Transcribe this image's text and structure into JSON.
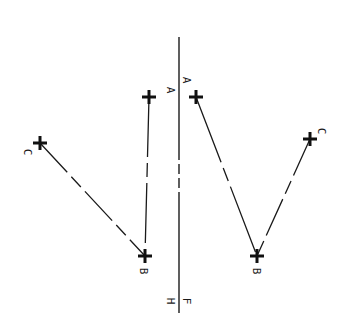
{
  "diagram": {
    "title": "",
    "colors": {
      "background": "#ffffff",
      "ink": "#1a1a1a"
    },
    "fold_line": {
      "x": 179,
      "y_top": 37,
      "y_bottom": 313,
      "top_labels": [
        "A",
        "A"
      ],
      "bottom_labels": [
        "H",
        "F"
      ],
      "dashed_segment": [
        150,
        200
      ]
    },
    "left_view": {
      "points": {
        "A": {
          "label": "A",
          "x": 149,
          "y": 97
        },
        "B": {
          "label": "B",
          "x": 145,
          "y": 256
        },
        "C": {
          "label": "C",
          "x": 40,
          "y": 143
        }
      },
      "lines": [
        {
          "from": "C",
          "to": "B",
          "style": "long-dash"
        },
        {
          "from": "A",
          "to": "B",
          "style": "long-dash"
        }
      ]
    },
    "right_view": {
      "points": {
        "A": {
          "label": "A",
          "x": 196,
          "y": 97
        },
        "B": {
          "label": "B",
          "x": 257,
          "y": 256
        },
        "C": {
          "label": "C",
          "x": 310,
          "y": 139
        }
      },
      "lines": [
        {
          "from": "A",
          "to": "B",
          "style": "long-dash"
        },
        {
          "from": "C",
          "to": "B",
          "style": "long-dash"
        }
      ]
    }
  }
}
